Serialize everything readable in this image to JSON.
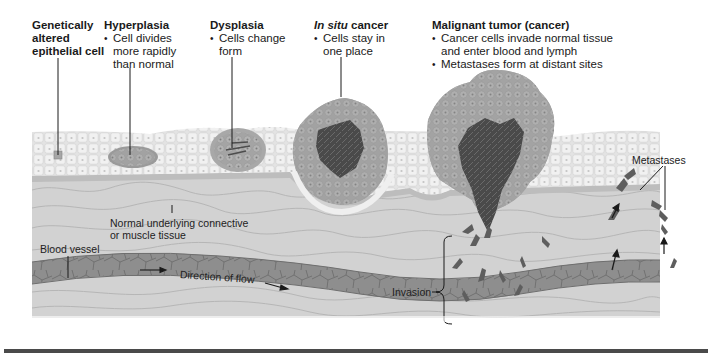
{
  "figure": {
    "stages": [
      {
        "id": "genetically-altered",
        "title_lines": [
          "Genetically",
          "altered",
          "epithelial cell"
        ],
        "bullets": []
      },
      {
        "id": "hyperplasia",
        "title": "Hyperplasia",
        "bullets": [
          [
            "Cell divides",
            "more rapidly",
            "than normal"
          ]
        ]
      },
      {
        "id": "dysplasia",
        "title": "Dysplasia",
        "bullets": [
          [
            "Cells change",
            "form"
          ]
        ]
      },
      {
        "id": "in-situ",
        "title_italic": "In situ",
        "title_rest": " cancer",
        "bullets": [
          [
            "Cells stay in",
            "one place"
          ]
        ]
      },
      {
        "id": "malignant",
        "title": "Malignant tumor (cancer)",
        "bullets": [
          [
            "Cancer cells invade normal tissue",
            "and enter blood and lymph"
          ],
          [
            "Metastases form at distant sites"
          ]
        ]
      }
    ],
    "labels": {
      "connective_tissue": [
        "Normal underlying connective",
        "or muscle tissue"
      ],
      "blood_vessel": "Blood vessel",
      "direction_of_flow": "Direction of flow",
      "invasion": "Invasion",
      "metastases": "Metastases"
    },
    "colors": {
      "epithelium": "#e6e6e6",
      "cell_outline": "#ffffff",
      "basement": "#bdbdbd",
      "connective": "#d0d0d0",
      "connective_lines": "#aaaaaa",
      "vessel": "#8a8a8a",
      "vessel_dark": "#6c6c6c",
      "tumor_outer": "#9d9d9d",
      "tumor_core": "#4a4a4a",
      "cancer_cell": "#5e5e5e",
      "rule": "#4a4a4a"
    }
  }
}
